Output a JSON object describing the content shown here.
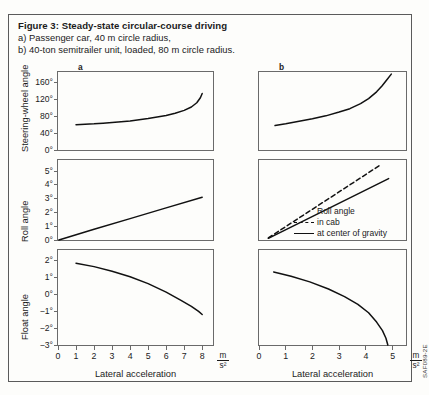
{
  "figure": {
    "title": "Figure 3: Steady-state circular-course driving",
    "line_a": "a) Passenger car, 40 m circle radius,",
    "line_b": "b) 40-ton semitrailer unit, loaded, 80 m circle radius.",
    "source_code": "SAF089-2E",
    "panel_a_letter": "a",
    "panel_b_letter": "b"
  },
  "axes": {
    "xlabel": "Lateral acceleration",
    "unit_num": "m",
    "unit_den": "s²",
    "steering_label": "Steering-wheel angle",
    "roll_label": "Roll angle",
    "float_label": "Float angle"
  },
  "legend": {
    "title": "Roll angle",
    "in_cab": "in cab",
    "at_cg": "at center of gravity"
  },
  "chart_data": [
    {
      "id": "a-steering",
      "type": "line",
      "title": "Steering-wheel angle (passenger car, 40 m radius)",
      "xlabel": "Lateral acceleration",
      "ylabel": "Steering-wheel angle",
      "xunit": "m/s²",
      "yunit": "degrees",
      "xlim": [
        0,
        8.6
      ],
      "ylim": [
        0,
        185
      ],
      "xticks": [
        0,
        1,
        2,
        3,
        4,
        5,
        6,
        7,
        8
      ],
      "xticklabels": [
        "0",
        "1",
        "2",
        "3",
        "4",
        "5",
        "6",
        "7",
        "8"
      ],
      "yticks": [
        0,
        40,
        80,
        120,
        160
      ],
      "yticklabels": [
        "0°",
        "40°",
        "80°",
        "120°",
        "160°"
      ],
      "grid": false,
      "series": [
        {
          "name": "steering-wheel angle",
          "style": "solid",
          "x": [
            1.0,
            1.5,
            2.0,
            2.5,
            3.0,
            3.5,
            4.0,
            4.5,
            5.0,
            5.5,
            6.0,
            6.5,
            7.0,
            7.4,
            7.7,
            7.9,
            8.0
          ],
          "y": [
            60,
            61,
            62,
            63.5,
            65,
            67,
            69,
            71.5,
            74.5,
            78,
            82,
            87,
            94,
            102,
            112,
            124,
            134
          ]
        }
      ]
    },
    {
      "id": "b-steering",
      "type": "line",
      "title": "Steering-wheel angle (40-ton semitrailer, 80 m radius)",
      "xlabel": "Lateral acceleration",
      "ylabel": "Steering-wheel angle",
      "xunit": "m/s²",
      "yunit": "degrees",
      "xlim": [
        0,
        5.5
      ],
      "ylim": [
        0,
        185
      ],
      "xticks": [
        0,
        1,
        2,
        3,
        4,
        5
      ],
      "xticklabels": [
        "0",
        "1",
        "2",
        "3",
        "4",
        "5"
      ],
      "yticks": [],
      "yticklabels": [],
      "grid": false,
      "series": [
        {
          "name": "steering-wheel angle",
          "style": "solid",
          "x": [
            0.6,
            1.0,
            1.5,
            2.0,
            2.5,
            3.0,
            3.4,
            3.8,
            4.1,
            4.4,
            4.6,
            4.8,
            4.95
          ],
          "y": [
            58,
            62,
            68,
            74,
            81,
            90,
            98,
            110,
            122,
            138,
            152,
            168,
            180
          ]
        }
      ]
    },
    {
      "id": "a-roll",
      "type": "line",
      "title": "Roll angle (passenger car, 40 m radius)",
      "xlabel": "Lateral acceleration",
      "ylabel": "Roll angle",
      "xunit": "m/s²",
      "yunit": "degrees",
      "xlim": [
        0,
        8.6
      ],
      "ylim": [
        0,
        5.8
      ],
      "xticks": [
        0,
        1,
        2,
        3,
        4,
        5,
        6,
        7,
        8
      ],
      "xticklabels": [
        "0",
        "1",
        "2",
        "3",
        "4",
        "5",
        "6",
        "7",
        "8"
      ],
      "yticks": [
        0,
        1,
        2,
        3,
        4,
        5
      ],
      "yticklabels": [
        "0°",
        "1°",
        "2°",
        "3°",
        "4°",
        "5°"
      ],
      "grid": false,
      "series": [
        {
          "name": "roll angle",
          "style": "solid",
          "x": [
            0.05,
            2.0,
            4.0,
            6.0,
            8.0
          ],
          "y": [
            0.0,
            0.78,
            1.55,
            2.33,
            3.1
          ]
        }
      ]
    },
    {
      "id": "b-roll",
      "type": "line",
      "title": "Roll angle (40-ton semitrailer, 80 m radius)",
      "xlabel": "Lateral acceleration",
      "ylabel": "Roll angle",
      "xunit": "m/s²",
      "yunit": "degrees",
      "xlim": [
        0,
        5.5
      ],
      "ylim": [
        0,
        5.8
      ],
      "xticks": [
        0,
        1,
        2,
        3,
        4,
        5
      ],
      "xticklabels": [
        "0",
        "1",
        "2",
        "3",
        "4",
        "5"
      ],
      "yticks": [],
      "yticklabels": [],
      "grid": false,
      "legend_position": "lower-right",
      "series": [
        {
          "name": "in cab",
          "style": "dashed",
          "x": [
            0.35,
            4.55
          ],
          "y": [
            0.15,
            5.45
          ]
        },
        {
          "name": "at center of gravity",
          "style": "solid",
          "x": [
            0.35,
            4.85
          ],
          "y": [
            0.12,
            4.45
          ]
        }
      ]
    },
    {
      "id": "a-float",
      "type": "line",
      "title": "Float angle (passenger car, 40 m radius)",
      "xlabel": "Lateral acceleration",
      "ylabel": "Float angle",
      "xunit": "m/s²",
      "yunit": "degrees",
      "xlim": [
        0,
        8.6
      ],
      "ylim": [
        -3,
        2.6
      ],
      "xticks": [
        0,
        1,
        2,
        3,
        4,
        5,
        6,
        7,
        8
      ],
      "xticklabels": [
        "0",
        "1",
        "2",
        "3",
        "4",
        "5",
        "6",
        "7",
        "8"
      ],
      "yticks": [
        -3,
        -2,
        -1,
        0,
        1,
        2
      ],
      "yticklabels": [
        "−3°",
        "−2°",
        "−1°",
        "0°",
        "1°",
        "2°"
      ],
      "grid": false,
      "series": [
        {
          "name": "float angle",
          "style": "solid",
          "x": [
            1.0,
            2.0,
            3.0,
            4.0,
            5.0,
            6.0,
            6.8,
            7.4,
            7.8,
            8.0
          ],
          "y": [
            1.82,
            1.62,
            1.35,
            1.02,
            0.62,
            0.12,
            -0.35,
            -0.72,
            -1.02,
            -1.2
          ]
        }
      ]
    },
    {
      "id": "b-float",
      "type": "line",
      "title": "Float angle (40-ton semitrailer, 80 m radius)",
      "xlabel": "Lateral acceleration",
      "ylabel": "Float angle",
      "xunit": "m/s²",
      "yunit": "degrees",
      "xlim": [
        0,
        5.5
      ],
      "ylim": [
        -3,
        2.6
      ],
      "xticks": [
        0,
        1,
        2,
        3,
        4,
        5
      ],
      "xticklabels": [
        "0",
        "1",
        "2",
        "3",
        "4",
        "5"
      ],
      "yticks": [],
      "yticklabels": [],
      "grid": false,
      "series": [
        {
          "name": "float angle",
          "style": "solid",
          "x": [
            0.55,
            1.2,
            1.9,
            2.6,
            3.2,
            3.7,
            4.1,
            4.4,
            4.62,
            4.75,
            4.82
          ],
          "y": [
            1.3,
            1.05,
            0.72,
            0.3,
            -0.15,
            -0.6,
            -1.1,
            -1.65,
            -2.15,
            -2.6,
            -3.0
          ]
        }
      ]
    }
  ]
}
